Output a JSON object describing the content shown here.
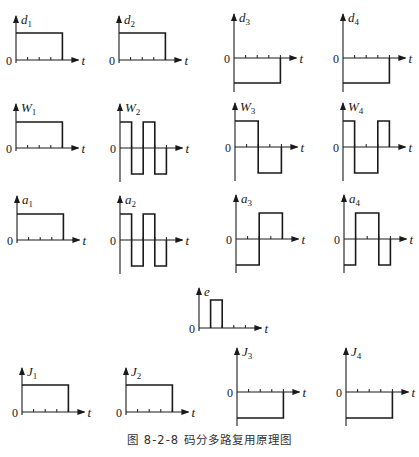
{
  "caption": "图 8-2-8   码分多路复用原理图",
  "axis_label_t": "t",
  "zero_label": "0",
  "colors": {
    "line": "#1a1a1a",
    "background": "#ffffff"
  },
  "plots": [
    {
      "id": "d1",
      "sym": "d",
      "sub": "1",
      "ox": 16,
      "oy": 60,
      "ticks": 4,
      "chips": [
        1,
        1,
        1,
        1
      ],
      "amp": 27
    },
    {
      "id": "d2",
      "sym": "d",
      "sub": "2",
      "ox": 119,
      "oy": 60,
      "ticks": 4,
      "chips": [
        1,
        1,
        1,
        1
      ],
      "amp": 27
    },
    {
      "id": "d3",
      "sym": "d",
      "sub": "3",
      "ox": 234,
      "oy": 58,
      "ticks": 4,
      "chips": [
        -1,
        -1,
        -1,
        -1
      ],
      "amp": 25
    },
    {
      "id": "d4",
      "sym": "d",
      "sub": "4",
      "ox": 343,
      "oy": 58,
      "ticks": 4,
      "chips": [
        -1,
        -1,
        -1,
        -1
      ],
      "amp": 25
    },
    {
      "id": "W1",
      "sym": "W",
      "sub": "1",
      "ox": 16,
      "oy": 148,
      "ticks": 4,
      "chips": [
        1,
        1,
        1,
        1
      ],
      "amp": 26
    },
    {
      "id": "W2",
      "sym": "W",
      "sub": "2",
      "ox": 120,
      "oy": 148,
      "ticks": 4,
      "chips": [
        1,
        -1,
        1,
        -1
      ],
      "amp": 26
    },
    {
      "id": "W3",
      "sym": "W",
      "sub": "3",
      "ox": 235,
      "oy": 147,
      "ticks": 4,
      "chips": [
        1,
        1,
        -1,
        -1
      ],
      "amp": 26
    },
    {
      "id": "W4",
      "sym": "W",
      "sub": "4",
      "ox": 343,
      "oy": 147,
      "ticks": 4,
      "chips": [
        1,
        -1,
        -1,
        1
      ],
      "amp": 26
    },
    {
      "id": "a1",
      "sym": "a",
      "sub": "1",
      "ox": 17,
      "oy": 240,
      "ticks": 4,
      "chips": [
        1,
        1,
        1,
        1
      ],
      "amp": 26
    },
    {
      "id": "a2",
      "sym": "a",
      "sub": "2",
      "ox": 120,
      "oy": 240,
      "ticks": 4,
      "chips": [
        1,
        -1,
        1,
        -1
      ],
      "amp": 26
    },
    {
      "id": "a3",
      "sym": "a",
      "sub": "3",
      "ox": 236,
      "oy": 239,
      "ticks": 4,
      "chips": [
        -1,
        -1,
        1,
        1
      ],
      "amp": 26
    },
    {
      "id": "a4",
      "sym": "a",
      "sub": "4",
      "ox": 344,
      "oy": 239,
      "ticks": 4,
      "chips": [
        -1,
        1,
        1,
        -1
      ],
      "amp": 26
    },
    {
      "id": "e",
      "sym": "e",
      "sub": "",
      "ox": 199,
      "oy": 328,
      "ticks": 4,
      "chips": [
        0,
        1,
        0,
        0
      ],
      "amp": 28
    },
    {
      "id": "J1",
      "sym": "J",
      "sub": "1",
      "ox": 22,
      "oy": 412,
      "ticks": 4,
      "chips": [
        1,
        1,
        1,
        1
      ],
      "amp": 27
    },
    {
      "id": "J2",
      "sym": "J",
      "sub": "2",
      "ox": 126,
      "oy": 412,
      "ticks": 4,
      "chips": [
        1,
        1,
        1,
        1
      ],
      "amp": 27
    },
    {
      "id": "J3",
      "sym": "J",
      "sub": "3",
      "ox": 237,
      "oy": 392,
      "ticks": 4,
      "chips": [
        -1,
        -1,
        -1,
        -1
      ],
      "amp": 26
    },
    {
      "id": "J4",
      "sym": "J",
      "sub": "4",
      "ox": 346,
      "oy": 392,
      "ticks": 4,
      "chips": [
        -1,
        -1,
        -1,
        -1
      ],
      "amp": 26
    }
  ],
  "layout": {
    "chip_width": 11.6,
    "axis_length": 62,
    "axis_top": 44,
    "axis_bottom_extra": 34
  }
}
